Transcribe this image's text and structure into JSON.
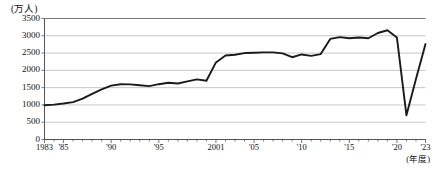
{
  "chart_data": {
    "type": "line",
    "title": "",
    "subtitle": "",
    "unit_label": "(万人)",
    "xlabel": "(年度)",
    "ylabel": "",
    "ylim": [
      0,
      3500
    ],
    "ytick_values": [
      0,
      500,
      1000,
      1500,
      2000,
      2500,
      3000,
      3500
    ],
    "ytick_labels": [
      "0",
      "500",
      "1000",
      "1500",
      "2000",
      "2500",
      "3000",
      "3500"
    ],
    "xlim": [
      1983,
      2023
    ],
    "xtick_labels": [
      "1983",
      "'85",
      "'90",
      "'95",
      "2001",
      "'05",
      "'10",
      "'15",
      "'20",
      "'23"
    ],
    "xtick_values": [
      1983,
      1985,
      1990,
      1995,
      2001,
      2005,
      2010,
      2015,
      2020,
      2023
    ],
    "grid": "horizontal",
    "legend": "none",
    "line_color": "#1a1a1a",
    "grid_color": "#b8b8b8",
    "axis_color": "#555555",
    "x": [
      1983,
      1984,
      1985,
      1986,
      1987,
      1988,
      1989,
      1990,
      1991,
      1992,
      1993,
      1994,
      1995,
      1996,
      1997,
      1998,
      1999,
      2000,
      2001,
      2002,
      2003,
      2004,
      2005,
      2006,
      2007,
      2008,
      2009,
      2010,
      2011,
      2012,
      2013,
      2014,
      2015,
      2016,
      2017,
      2018,
      2019,
      2020,
      2021,
      2022,
      2023
    ],
    "values": [
      990,
      1010,
      1040,
      1080,
      1180,
      1320,
      1450,
      1560,
      1600,
      1595,
      1570,
      1545,
      1600,
      1640,
      1620,
      1680,
      1740,
      1700,
      2230,
      2430,
      2450,
      2500,
      2510,
      2520,
      2520,
      2490,
      2380,
      2460,
      2420,
      2470,
      2910,
      2960,
      2930,
      2950,
      2930,
      3080,
      3160,
      2950,
      700,
      1750,
      2760
    ],
    "series_name": "利用者数",
    "annotations": []
  },
  "caption": {
    "text": ""
  }
}
